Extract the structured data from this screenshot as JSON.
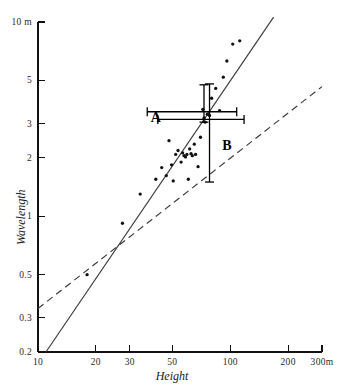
{
  "chart_data": {
    "type": "scatter",
    "title": "",
    "xlabel": "Height",
    "ylabel": "Wavelength",
    "xscale": "log",
    "yscale": "log",
    "xlim": [
      10,
      300
    ],
    "ylim": [
      0.2,
      10
    ],
    "grid": false,
    "legend": null,
    "xticks": [
      {
        "value": 10,
        "label": "10"
      },
      {
        "value": 20,
        "label": "20"
      },
      {
        "value": 30,
        "label": "30"
      },
      {
        "value": 50,
        "label": "50"
      },
      {
        "value": 100,
        "label": "100"
      },
      {
        "value": 200,
        "label": "200"
      },
      {
        "value": 300,
        "label": "300m"
      }
    ],
    "yticks": [
      {
        "value": 10,
        "label": "10 m"
      },
      {
        "value": 5,
        "label": "5"
      },
      {
        "value": 3,
        "label": "3"
      },
      {
        "value": 2,
        "label": "2"
      },
      {
        "value": 1,
        "label": "1"
      },
      {
        "value": 0.5,
        "label": "0.5"
      },
      {
        "value": 0.3,
        "label": "0.3"
      },
      {
        "value": 0.2,
        "label": "0.2"
      }
    ],
    "series": [
      {
        "name": "observations",
        "type": "scatter",
        "marker": "dot",
        "color": "#111111",
        "points": [
          [
            18.0,
            0.5
          ],
          [
            27.5,
            0.92
          ],
          [
            34.0,
            1.3
          ],
          [
            41.0,
            1.55
          ],
          [
            44.0,
            1.78
          ],
          [
            46.5,
            1.62
          ],
          [
            48.0,
            2.45
          ],
          [
            49.5,
            1.84
          ],
          [
            50.5,
            1.52
          ],
          [
            52.0,
            2.08
          ],
          [
            53.5,
            2.18
          ],
          [
            55.5,
            1.9
          ],
          [
            56.5,
            2.12
          ],
          [
            57.5,
            2.05
          ],
          [
            58.5,
            2.02
          ],
          [
            59.5,
            2.08
          ],
          [
            60.5,
            1.55
          ],
          [
            61.5,
            2.22
          ],
          [
            62.5,
            2.1
          ],
          [
            63.5,
            2.05
          ],
          [
            65.0,
            2.35
          ],
          [
            66.0,
            2.08
          ],
          [
            68.0,
            1.8
          ],
          [
            70.0,
            2.55
          ],
          [
            72.0,
            3.55
          ],
          [
            73.0,
            3.2
          ],
          [
            74.0,
            3.05
          ],
          [
            76.0,
            3.35
          ],
          [
            78.0,
            3.3
          ],
          [
            80.0,
            4.05
          ],
          [
            84.0,
            4.55
          ],
          [
            88.0,
            3.5
          ],
          [
            92.0,
            5.2
          ],
          [
            96.0,
            6.3
          ],
          [
            103.0,
            7.7
          ],
          [
            112.0,
            8.0
          ]
        ]
      },
      {
        "name": "fit-line-solid",
        "type": "line",
        "style": "solid",
        "color": "#3a3a3a",
        "endpoints": [
          [
            11.0,
            0.2
          ],
          [
            168.0,
            10.6
          ]
        ]
      },
      {
        "name": "reference-line-dashed",
        "type": "line",
        "style": "dashed",
        "color": "#3a3a3a",
        "endpoints": [
          [
            10.0,
            0.335
          ],
          [
            300.0,
            4.65
          ]
        ]
      }
    ],
    "annotations": [
      {
        "label": "A",
        "type": "errorbar-cross",
        "x": 73.0,
        "y": 3.45,
        "xerr_low": 37.0,
        "xerr_high": 108.0,
        "yerr_low": 3.05,
        "yerr_high": 4.75,
        "label_x": 41.0,
        "label_y": 3.2
      },
      {
        "label": "B",
        "type": "errorbar-cross",
        "x": 78.0,
        "y": 3.15,
        "xerr_low": 42.0,
        "xerr_high": 118.0,
        "yerr_low": 1.5,
        "yerr_high": 4.8,
        "label_x": 96.0,
        "label_y": 2.3
      }
    ]
  },
  "axis": {
    "x_title": "Height",
    "y_title": "Wavelength"
  },
  "colors": {
    "axis": "#111111",
    "line": "#3a3a3a",
    "marker": "#111111",
    "errorbar": "#000000",
    "background": "#ffffff"
  }
}
